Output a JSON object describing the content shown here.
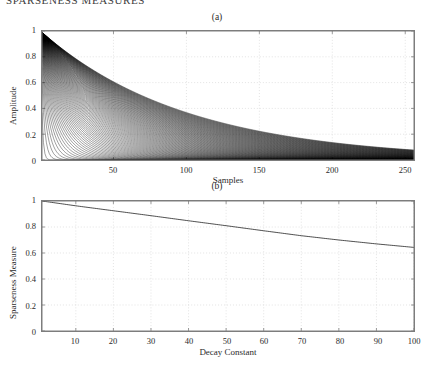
{
  "running_head": "SPARSENESS MEASURES",
  "figure": {
    "panels": [
      {
        "caption": "(a)",
        "xlabel": "Samples",
        "ylabel": "Amplitude",
        "xticks": [
          "50",
          "100",
          "150",
          "200",
          "250"
        ],
        "yticks": [
          "0",
          "0.2",
          "0.4",
          "0.6",
          "0.8",
          "1"
        ]
      },
      {
        "caption": "(b)",
        "xlabel": "Decay Constant",
        "ylabel": "Sparseness Measure",
        "xticks": [
          "10",
          "20",
          "30",
          "40",
          "50",
          "60",
          "70",
          "80",
          "90",
          "100"
        ],
        "yticks": [
          "0",
          "0.2",
          "0.4",
          "0.6",
          "0.8",
          "1"
        ]
      }
    ]
  },
  "colors": {
    "curve": "#000000",
    "axis": "#7d7d7d",
    "grid": "#cfcfcf",
    "background": "#ffffff"
  },
  "chart_data": [
    {
      "type": "line",
      "title": "(a)",
      "xlabel": "Samples",
      "ylabel": "Amplitude",
      "xlim": [
        1,
        256
      ],
      "ylim": [
        0,
        1
      ],
      "xticks": [
        50,
        100,
        150,
        200,
        250
      ],
      "yticks": [
        0,
        0.2,
        0.4,
        0.6,
        0.8,
        1
      ],
      "grid": true,
      "legend": "none",
      "description": "Family of decaying exponential envelopes exp(-n/tau) for decay constants tau = 1..100, overlaid so densely that the region under the slowest decay appears solid black.",
      "series": [
        {
          "name": "tau=1",
          "formula": "exp(-n/1)",
          "x": [
            1,
            32,
            64,
            96,
            128,
            160,
            192,
            224,
            256
          ],
          "values": [
            1.0,
            0.0,
            0.0,
            0.0,
            0.0,
            0.0,
            0.0,
            0.0,
            0.0
          ]
        },
        {
          "name": "tau=5",
          "formula": "exp(-n/5)",
          "x": [
            1,
            32,
            64,
            96,
            128,
            160,
            192,
            224,
            256
          ],
          "values": [
            1.0,
            0.002,
            0.0,
            0.0,
            0.0,
            0.0,
            0.0,
            0.0,
            0.0
          ]
        },
        {
          "name": "tau=10",
          "formula": "exp(-n/10)",
          "x": [
            1,
            32,
            64,
            96,
            128,
            160,
            192,
            224,
            256
          ],
          "values": [
            1.0,
            0.041,
            0.002,
            0.0,
            0.0,
            0.0,
            0.0,
            0.0,
            0.0
          ]
        },
        {
          "name": "tau=20",
          "formula": "exp(-n/20)",
          "x": [
            1,
            32,
            64,
            96,
            128,
            160,
            192,
            224,
            256
          ],
          "values": [
            1.0,
            0.202,
            0.041,
            0.008,
            0.002,
            0.0,
            0.0,
            0.0,
            0.0
          ]
        },
        {
          "name": "tau=30",
          "formula": "exp(-n/30)",
          "x": [
            1,
            32,
            64,
            96,
            128,
            160,
            192,
            224,
            256
          ],
          "values": [
            1.0,
            0.345,
            0.119,
            0.041,
            0.014,
            0.005,
            0.002,
            0.001,
            0.0
          ]
        },
        {
          "name": "tau=40",
          "formula": "exp(-n/40)",
          "x": [
            1,
            32,
            64,
            96,
            128,
            160,
            192,
            224,
            256
          ],
          "values": [
            1.0,
            0.449,
            0.202,
            0.091,
            0.041,
            0.018,
            0.008,
            0.004,
            0.002
          ]
        },
        {
          "name": "tau=50",
          "formula": "exp(-n/50)",
          "x": [
            1,
            32,
            64,
            96,
            128,
            160,
            192,
            224,
            256
          ],
          "values": [
            1.0,
            0.527,
            0.278,
            0.147,
            0.077,
            0.041,
            0.021,
            0.011,
            0.006
          ]
        },
        {
          "name": "tau=60",
          "formula": "exp(-n/60)",
          "x": [
            1,
            32,
            64,
            96,
            128,
            160,
            192,
            224,
            256
          ],
          "values": [
            1.0,
            0.587,
            0.345,
            0.202,
            0.119,
            0.07,
            0.041,
            0.024,
            0.014
          ]
        },
        {
          "name": "tau=70",
          "formula": "exp(-n/70)",
          "x": [
            1,
            32,
            64,
            96,
            128,
            160,
            192,
            224,
            256
          ],
          "values": [
            1.0,
            0.634,
            0.402,
            0.255,
            0.162,
            0.102,
            0.065,
            0.041,
            0.026
          ]
        },
        {
          "name": "tau=80",
          "formula": "exp(-n/80)",
          "x": [
            1,
            32,
            64,
            96,
            128,
            160,
            192,
            224,
            256
          ],
          "values": [
            1.0,
            0.67,
            0.449,
            0.301,
            0.202,
            0.135,
            0.091,
            0.061,
            0.041
          ]
        },
        {
          "name": "tau=90",
          "formula": "exp(-n/90)",
          "x": [
            1,
            32,
            64,
            96,
            128,
            160,
            192,
            224,
            256
          ],
          "values": [
            1.0,
            0.7,
            0.49,
            0.344,
            0.241,
            0.169,
            0.118,
            0.083,
            0.058
          ]
        },
        {
          "name": "tau=100",
          "formula": "exp(-n/100)",
          "x": [
            1,
            32,
            64,
            96,
            128,
            160,
            192,
            224,
            256
          ],
          "values": [
            1.0,
            0.726,
            0.527,
            0.383,
            0.278,
            0.202,
            0.147,
            0.106,
            0.077
          ]
        }
      ]
    },
    {
      "type": "line",
      "title": "(b)",
      "xlabel": "Decay Constant",
      "ylabel": "Sparseness Measure",
      "xlim": [
        1,
        100
      ],
      "ylim": [
        0,
        1
      ],
      "xticks": [
        10,
        20,
        30,
        40,
        50,
        60,
        70,
        80,
        90,
        100
      ],
      "yticks": [
        0,
        0.2,
        0.4,
        0.6,
        0.8,
        1
      ],
      "grid": true,
      "legend": "none",
      "description": "Sparseness measure decreases almost linearly from 1.0 at decay constant 1 to about 0.64 at decay constant 100.",
      "x": [
        1,
        10,
        20,
        30,
        40,
        50,
        60,
        70,
        80,
        90,
        100
      ],
      "values": [
        1.0,
        0.963,
        0.925,
        0.887,
        0.848,
        0.81,
        0.771,
        0.733,
        0.7,
        0.67,
        0.643
      ]
    }
  ]
}
